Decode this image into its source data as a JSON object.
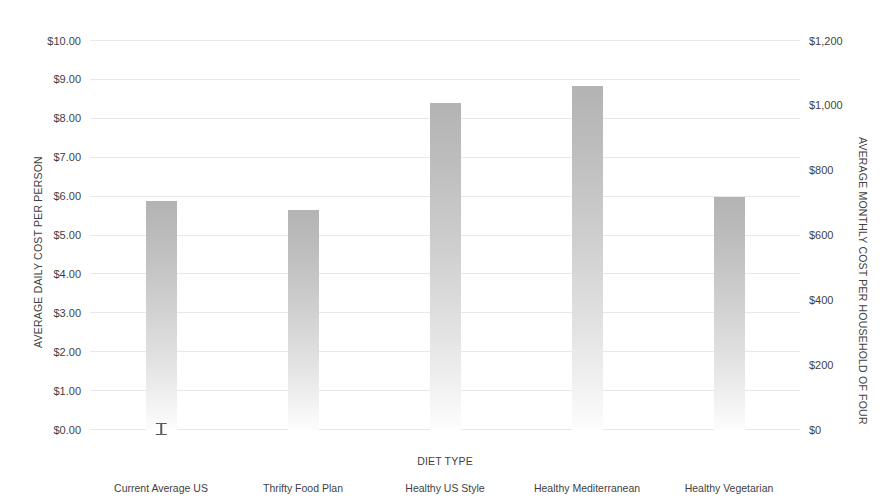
{
  "chart_data": {
    "type": "bar",
    "title": "",
    "xlabel": "DIET TYPE",
    "ylabel": "AVERAGE DAILY COST PER PERSON",
    "ylabel_secondary": "AVERAGE MONTHLY COST PER HOUSEHOLD OF FOUR",
    "categories": [
      "Current Average US",
      "Thrifty Food Plan",
      "Healthy US Style",
      "Healthy Mediterranean",
      "Healthy Vegetarian"
    ],
    "values": [
      5.88,
      5.65,
      8.4,
      8.85,
      5.98
    ],
    "values_secondary": [
      706,
      678,
      1008,
      1062,
      718
    ],
    "errors": [
      {
        "category": "Current Average US",
        "low": 5.74,
        "high": 6.07
      },
      {
        "category": "Thrifty Food Plan",
        "low": null,
        "high": null
      },
      {
        "category": "Healthy US Style",
        "low": null,
        "high": null
      },
      {
        "category": "Healthy Mediterranean",
        "low": null,
        "high": null
      },
      {
        "category": "Healthy Vegetarian",
        "low": null,
        "high": null
      }
    ],
    "ylim": [
      0,
      10
    ],
    "ylim_secondary": [
      0,
      1200
    ],
    "ytick_labels": [
      "$0.00",
      "$1.00",
      "$2.00",
      "$3.00",
      "$4.00",
      "$5.00",
      "$6.00",
      "$7.00",
      "$8.00",
      "$9.00",
      "$10.00"
    ],
    "ytick_values": [
      0,
      1,
      2,
      3,
      4,
      5,
      6,
      7,
      8,
      9,
      10
    ],
    "ytick_labels_secondary": [
      "$0",
      "$200",
      "$400",
      "$600",
      "$800",
      "$1,000",
      "$1,200"
    ],
    "ytick_values_secondary": [
      0,
      200,
      400,
      600,
      800,
      1000,
      1200
    ],
    "grid": true,
    "legend": null,
    "bar_color_top": "#b3b3b3",
    "bar_color_bottom": "#fdfdfd",
    "gridline_color": "#e8e8e8",
    "errorbar_color": "#5a5a5a",
    "text_color": "#3f3f3f",
    "background": "#ffffff"
  }
}
